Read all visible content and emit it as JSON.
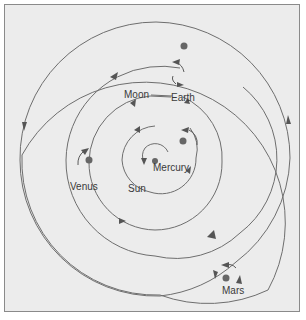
{
  "diagram": {
    "title": "",
    "colors": {
      "background": "#ececec",
      "border": "#8a8a8a",
      "line": "#6e6e6e",
      "planet": "#666666",
      "text": "#3a3a3a"
    },
    "labels": {
      "moon": "Moon",
      "earth": "Earth",
      "venus": "Venus",
      "sun": "Sun",
      "mercury": "Mercury",
      "mars": "Mars"
    },
    "bodies": [
      {
        "name": "Mercury",
        "x": 155,
        "y": 161
      },
      {
        "name": "Sun-orbit body",
        "x": 183,
        "y": 141
      },
      {
        "name": "Venus",
        "x": 89,
        "y": 160
      },
      {
        "name": "Earth",
        "x": 184,
        "y": 46
      },
      {
        "name": "Mars",
        "x": 226,
        "y": 278
      }
    ]
  }
}
